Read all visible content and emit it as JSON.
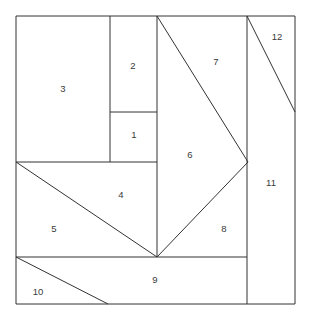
{
  "figure": {
    "background_color": "#ffffff",
    "line_color": "#333333",
    "label_color": "#3a3a3a",
    "width": 313,
    "height": 314
  },
  "frame": {
    "x": 16,
    "y": 16,
    "width": 279,
    "height": 288
  },
  "chart_data": {
    "type": "diagram-dissection",
    "units": "pixels",
    "outer_rectangle": {
      "x0": 16,
      "y0": 16,
      "x1": 295,
      "y1": 304
    },
    "regions": [
      {
        "id": 1,
        "label": "1",
        "label_x": 134,
        "label_y": 135,
        "shape": "rectangle",
        "vertices": [
          [
            110,
            112
          ],
          [
            157,
            112
          ],
          [
            157,
            162
          ],
          [
            110,
            162
          ]
        ]
      },
      {
        "id": 2,
        "label": "2",
        "label_x": 133,
        "label_y": 66,
        "shape": "rectangle",
        "vertices": [
          [
            110,
            16
          ],
          [
            157,
            16
          ],
          [
            157,
            112
          ],
          [
            110,
            112
          ]
        ]
      },
      {
        "id": 3,
        "label": "3",
        "label_x": 63,
        "label_y": 89,
        "shape": "rectangle",
        "vertices": [
          [
            16,
            16
          ],
          [
            110,
            16
          ],
          [
            110,
            162
          ],
          [
            16,
            162
          ]
        ]
      },
      {
        "id": 4,
        "label": "4",
        "label_x": 121,
        "label_y": 195,
        "shape": "triangle",
        "vertices": [
          [
            16,
            162
          ],
          [
            157,
            162
          ],
          [
            157,
            257
          ]
        ]
      },
      {
        "id": 5,
        "label": "5",
        "label_x": 54,
        "label_y": 229,
        "shape": "triangle",
        "vertices": [
          [
            16,
            162
          ],
          [
            157,
            257
          ],
          [
            16,
            257
          ]
        ]
      },
      {
        "id": 6,
        "label": "6",
        "label_x": 190,
        "label_y": 155,
        "shape": "triangle",
        "vertices": [
          [
            157,
            16
          ],
          [
            248,
            162
          ],
          [
            157,
            257
          ]
        ]
      },
      {
        "id": 7,
        "label": "7",
        "label_x": 216,
        "label_y": 62,
        "shape": "triangle",
        "vertices": [
          [
            157,
            16
          ],
          [
            247,
            16
          ],
          [
            248,
            162
          ]
        ]
      },
      {
        "id": 8,
        "label": "8",
        "label_x": 224,
        "label_y": 229,
        "shape": "triangle",
        "vertices": [
          [
            248,
            162
          ],
          [
            247,
            257
          ],
          [
            157,
            257
          ]
        ]
      },
      {
        "id": 9,
        "label": "9",
        "label_x": 155,
        "label_y": 280,
        "shape": "rectangle",
        "vertices": [
          [
            16,
            257
          ],
          [
            247,
            257
          ],
          [
            247,
            304
          ],
          [
            16,
            304
          ]
        ]
      },
      {
        "id": 10,
        "label": "10",
        "label_x": 38,
        "label_y": 292,
        "shape": "triangle",
        "vertices": [
          [
            16,
            257
          ],
          [
            108,
            304
          ],
          [
            16,
            304
          ]
        ]
      },
      {
        "id": 11,
        "label": "11",
        "label_x": 271,
        "label_y": 183,
        "shape": "polygon",
        "vertices": [
          [
            247,
            16
          ],
          [
            295,
            112
          ],
          [
            295,
            304
          ],
          [
            247,
            304
          ]
        ]
      },
      {
        "id": 12,
        "label": "12",
        "label_x": 277,
        "label_y": 37,
        "shape": "triangle",
        "vertices": [
          [
            247,
            16
          ],
          [
            295,
            16
          ],
          [
            295,
            112
          ]
        ]
      }
    ],
    "edges": [
      {
        "name": "outer-top",
        "from": [
          16,
          16
        ],
        "to": [
          295,
          16
        ]
      },
      {
        "name": "outer-right",
        "from": [
          295,
          16
        ],
        "to": [
          295,
          304
        ]
      },
      {
        "name": "outer-bottom",
        "from": [
          295,
          304
        ],
        "to": [
          16,
          304
        ]
      },
      {
        "name": "outer-left",
        "from": [
          16,
          304
        ],
        "to": [
          16,
          16
        ]
      },
      {
        "name": "v-3-right",
        "from": [
          110,
          16
        ],
        "to": [
          110,
          162
        ]
      },
      {
        "name": "h-2-1-split",
        "from": [
          110,
          112
        ],
        "to": [
          157,
          112
        ]
      },
      {
        "name": "h-1-bottom",
        "from": [
          16,
          162
        ],
        "to": [
          157,
          162
        ]
      },
      {
        "name": "v-center",
        "from": [
          157,
          16
        ],
        "to": [
          157,
          257
        ]
      },
      {
        "name": "diag-7-6",
        "from": [
          157,
          16
        ],
        "to": [
          248,
          162
        ]
      },
      {
        "name": "diag-6-8",
        "from": [
          248,
          162
        ],
        "to": [
          157,
          257
        ]
      },
      {
        "name": "diag-4-5",
        "from": [
          16,
          162
        ],
        "to": [
          157,
          257
        ]
      },
      {
        "name": "h-9-top",
        "from": [
          16,
          257
        ],
        "to": [
          247,
          257
        ]
      },
      {
        "name": "v-11-left",
        "from": [
          247,
          16
        ],
        "to": [
          247,
          304
        ]
      },
      {
        "name": "diag-12",
        "from": [
          247,
          16
        ],
        "to": [
          295,
          112
        ]
      },
      {
        "name": "diag-10",
        "from": [
          16,
          257
        ],
        "to": [
          108,
          304
        ]
      }
    ]
  }
}
